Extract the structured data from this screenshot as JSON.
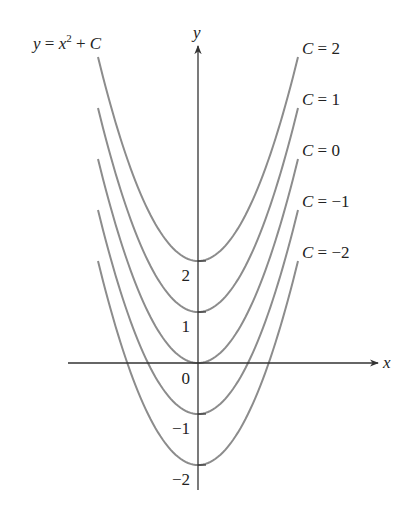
{
  "chart_data": {
    "type": "line",
    "title_parts": {
      "lhs": "y",
      "eq": " = ",
      "x": "x",
      "exp": "2",
      "plus": " + ",
      "c": "C"
    },
    "xlabel": "x",
    "ylabel": "y",
    "xlim": [
      -2.0,
      2.0
    ],
    "ylim": [
      -2.5,
      6.1
    ],
    "yticks": [
      2,
      1,
      0,
      -1,
      -2
    ],
    "ytick_labels": [
      "2",
      "1",
      "0",
      "−1",
      "−2"
    ],
    "grid": false,
    "legend_position": "right, labels at curve ends",
    "series": [
      {
        "name": "C = 2",
        "C": 2,
        "label_c": "C",
        "label_eq": " = ",
        "label_val": "2"
      },
      {
        "name": "C = 1",
        "C": 1,
        "label_c": "C",
        "label_eq": " = ",
        "label_val": "1"
      },
      {
        "name": "C = 0",
        "C": 0,
        "label_c": "C",
        "label_eq": " = ",
        "label_val": "0"
      },
      {
        "name": "C = −1",
        "C": -1,
        "label_c": "C",
        "label_eq": " = ",
        "label_val": "−1"
      },
      {
        "name": "C = −2",
        "C": -2,
        "label_c": "C",
        "label_eq": " = ",
        "label_val": "−2"
      }
    ],
    "colors": {
      "curve": "#8c8c8c",
      "axis": "#333333",
      "text": "#222222"
    }
  }
}
